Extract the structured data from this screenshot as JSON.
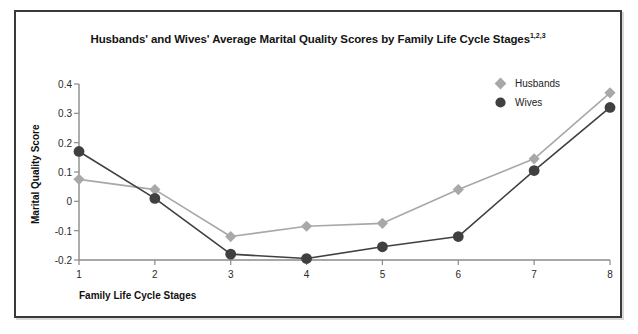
{
  "figure": {
    "title_main": "Husbands' and Wives' Average Marital Quality Scores by Family Life Cycle Stages",
    "title_superscript": "1,2,3"
  },
  "legend": {
    "position": "top-right",
    "entries": [
      {
        "label": "Husbands",
        "marker": "diamond-marker-icon",
        "color": "#a8a8a8"
      },
      {
        "label": "Wives",
        "marker": "circle-marker-icon",
        "color": "#404040"
      }
    ]
  },
  "chart_data": {
    "type": "line",
    "title": "Husbands' and Wives' Average Marital Quality Scores by Family Life Cycle Stages",
    "xlabel": "Family Life Cycle Stages",
    "ylabel": "Marital Quality Score",
    "categories": [
      "1",
      "2",
      "3",
      "4",
      "5",
      "6",
      "7",
      "8"
    ],
    "x": [
      1,
      2,
      3,
      4,
      5,
      6,
      7,
      8
    ],
    "xlim": [
      1,
      8
    ],
    "ylim": [
      -0.2,
      0.4
    ],
    "yticks": [
      "0.4",
      "0.3",
      "0.2",
      "0.1",
      "0",
      "-0.1",
      "-0.2"
    ],
    "ytick_values": [
      0.4,
      0.3,
      0.2,
      0.1,
      0,
      -0.1,
      -0.2
    ],
    "grid": false,
    "series": [
      {
        "name": "Husbands",
        "color": "#a8a8a8",
        "marker": "diamond",
        "values": [
          0.075,
          0.04,
          -0.12,
          -0.085,
          -0.075,
          0.04,
          0.145,
          0.37
        ]
      },
      {
        "name": "Wives",
        "color": "#404040",
        "marker": "circle",
        "values": [
          0.17,
          0.01,
          -0.18,
          -0.195,
          -0.155,
          -0.12,
          0.105,
          0.32
        ]
      }
    ]
  }
}
